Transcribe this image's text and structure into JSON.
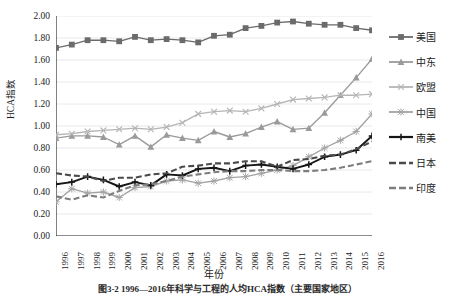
{
  "chart_data": {
    "type": "line",
    "title": "",
    "xlabel": "年份",
    "ylabel": "HCA指数",
    "x": [
      1996,
      1997,
      1998,
      1999,
      2000,
      2001,
      2002,
      2003,
      2004,
      2005,
      2006,
      2007,
      2008,
      2009,
      2010,
      2011,
      2012,
      2013,
      2014,
      2015,
      2016
    ],
    "categories": [
      "1996",
      "1997",
      "1998",
      "1999",
      "2000",
      "2001",
      "2002",
      "2003",
      "2004",
      "2005",
      "2006",
      "2007",
      "2008",
      "2009",
      "2010",
      "2011",
      "2012",
      "2013",
      "2014",
      "2015",
      "2016"
    ],
    "ylim": [
      0.0,
      2.0
    ],
    "ytick_values": [
      "0.00",
      "0.20",
      "0.40",
      "0.60",
      "0.80",
      "1.00",
      "1.20",
      "1.40",
      "1.60",
      "1.80",
      "2.00"
    ],
    "grid": true,
    "grid_axis": "y",
    "legend_position": "right",
    "series": [
      {
        "name": "美国",
        "marker": "square",
        "color": "#6b6b6b",
        "linestyle": "solid",
        "values": [
          1.71,
          1.74,
          1.78,
          1.78,
          1.77,
          1.81,
          1.78,
          1.79,
          1.78,
          1.76,
          1.82,
          1.83,
          1.89,
          1.91,
          1.94,
          1.95,
          1.93,
          1.92,
          1.92,
          1.89,
          1.87
        ]
      },
      {
        "name": "中东",
        "marker": "triangle",
        "color": "#9a9a9a",
        "linestyle": "solid",
        "values": [
          0.89,
          0.91,
          0.91,
          0.9,
          0.83,
          0.91,
          0.81,
          0.92,
          0.89,
          0.87,
          0.95,
          0.9,
          0.93,
          0.99,
          1.04,
          0.97,
          0.98,
          1.12,
          1.28,
          1.44,
          1.61
        ]
      },
      {
        "name": "欧盟",
        "marker": "x",
        "color": "#b5b5b5",
        "linestyle": "solid",
        "values": [
          0.92,
          0.93,
          0.95,
          0.96,
          0.97,
          0.98,
          0.97,
          0.99,
          1.03,
          1.11,
          1.13,
          1.14,
          1.13,
          1.16,
          1.2,
          1.24,
          1.25,
          1.26,
          1.28,
          1.28,
          1.29
        ]
      },
      {
        "name": "中国",
        "marker": "asterisk",
        "color": "#a3a3a3",
        "linestyle": "solid",
        "values": [
          0.31,
          0.43,
          0.39,
          0.4,
          0.35,
          0.44,
          0.45,
          0.5,
          0.51,
          0.48,
          0.5,
          0.53,
          0.54,
          0.57,
          0.6,
          0.64,
          0.72,
          0.8,
          0.87,
          0.95,
          1.11
        ]
      },
      {
        "name": "南美",
        "marker": "plus",
        "color": "#161616",
        "linestyle": "solid",
        "values": [
          0.47,
          0.49,
          0.54,
          0.51,
          0.45,
          0.49,
          0.46,
          0.56,
          0.55,
          0.61,
          0.62,
          0.59,
          0.64,
          0.65,
          0.63,
          0.61,
          0.65,
          0.72,
          0.74,
          0.78,
          0.91
        ]
      },
      {
        "name": "日本",
        "marker": "none",
        "color": "#4a4a4a",
        "linestyle": "dashed",
        "values": [
          0.57,
          0.55,
          0.54,
          0.5,
          0.53,
          0.53,
          0.56,
          0.57,
          0.63,
          0.64,
          0.66,
          0.66,
          0.68,
          0.68,
          0.63,
          0.69,
          0.7,
          0.73,
          0.74,
          0.79,
          0.86
        ]
      },
      {
        "name": "印度",
        "marker": "none",
        "color": "#7d7d7d",
        "linestyle": "dashed",
        "values": [
          0.36,
          0.33,
          0.37,
          0.35,
          0.41,
          0.46,
          0.47,
          0.5,
          0.54,
          0.56,
          0.58,
          0.59,
          0.59,
          0.6,
          0.6,
          0.59,
          0.59,
          0.6,
          0.62,
          0.65,
          0.68
        ]
      }
    ]
  },
  "caption": {
    "text": "图3-2  1996—2016年科学与工程的人均HCA指数（主要国家地区）"
  }
}
